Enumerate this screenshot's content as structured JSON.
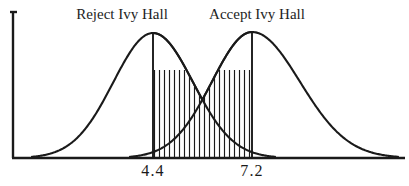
{
  "chart_data": {
    "type": "line",
    "title": "",
    "xlabel": "",
    "ylabel": "",
    "grid": false,
    "legend_position": "above-curves",
    "axis": {
      "x_start_px": 12,
      "x_end_px": 405,
      "baseline_px": 158,
      "y_top_px": 11
    },
    "annotations": [
      {
        "name": "reject-region-label",
        "text": "Reject Ivy Hall",
        "x_px": 122,
        "y_px": 8
      },
      {
        "name": "accept-region-label",
        "text": "Accept Ivy Hall",
        "x_px": 257,
        "y_px": 8
      }
    ],
    "cutoffs": [
      {
        "name": "lower-cutoff",
        "label": "4.4",
        "value": 4.4,
        "x_px": 153
      },
      {
        "name": "upper-cutoff",
        "label": "7.2",
        "value": 7.2,
        "x_px": 252
      }
    ],
    "tick_labels": [
      "4.4",
      "7.2"
    ],
    "series": [
      {
        "name": "Reject Ivy Hall",
        "curve": "normal",
        "mean_px": 153,
        "peak_y_px": 33,
        "left_tail_px": 32,
        "right_tail_px": 275,
        "color": "#1a1a1a"
      },
      {
        "name": "Accept Ivy Hall",
        "curve": "normal",
        "mean_px": 252,
        "peak_y_px": 32,
        "left_tail_px": 130,
        "right_tail_px": 398,
        "color": "#1a1a1a"
      }
    ],
    "overlap_region": {
      "name": "hatched-overlap",
      "from_label": "4.4",
      "to_label": "7.2",
      "apex_x_px": 203,
      "apex_y_px": 76,
      "hatch_style": "vertical-lines",
      "hatch_spacing_px": 5
    }
  },
  "labels": {
    "reject": "Reject Ivy Hall",
    "accept": "Accept Ivy Hall",
    "lower_cut": "4.4",
    "upper_cut": "7.2"
  },
  "colors": {
    "ink": "#1a1a1a",
    "paper": "#ffffff"
  }
}
